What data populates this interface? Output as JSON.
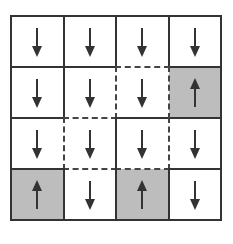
{
  "grid": {
    "rows": 4,
    "cols": 4,
    "cells": [
      [
        {
          "arrow": "down",
          "shaded": false
        },
        {
          "arrow": "down",
          "shaded": false
        },
        {
          "arrow": "down",
          "shaded": false
        },
        {
          "arrow": "down",
          "shaded": false
        }
      ],
      [
        {
          "arrow": "down",
          "shaded": false
        },
        {
          "arrow": "down",
          "shaded": false
        },
        {
          "arrow": "down",
          "shaded": false
        },
        {
          "arrow": "up",
          "shaded": true
        }
      ],
      [
        {
          "arrow": "down",
          "shaded": false
        },
        {
          "arrow": "down",
          "shaded": false
        },
        {
          "arrow": "down",
          "shaded": false
        },
        {
          "arrow": "down",
          "shaded": false
        }
      ],
      [
        {
          "arrow": "up",
          "shaded": true
        },
        {
          "arrow": "down",
          "shaded": false
        },
        {
          "arrow": "up",
          "shaded": true
        },
        {
          "arrow": "down",
          "shaded": false
        }
      ]
    ],
    "dashed_horizontal": [
      [
        1,
        2
      ],
      [
        2,
        1
      ],
      [
        3,
        1
      ],
      [
        3,
        2
      ]
    ],
    "dashed_vertical": [
      [
        1,
        2
      ],
      [
        1,
        3
      ],
      [
        2,
        1
      ],
      [
        2,
        3
      ]
    ],
    "colors": {
      "line": "#333333",
      "shade": "#bdbdbd",
      "arrow": "#333333"
    }
  }
}
